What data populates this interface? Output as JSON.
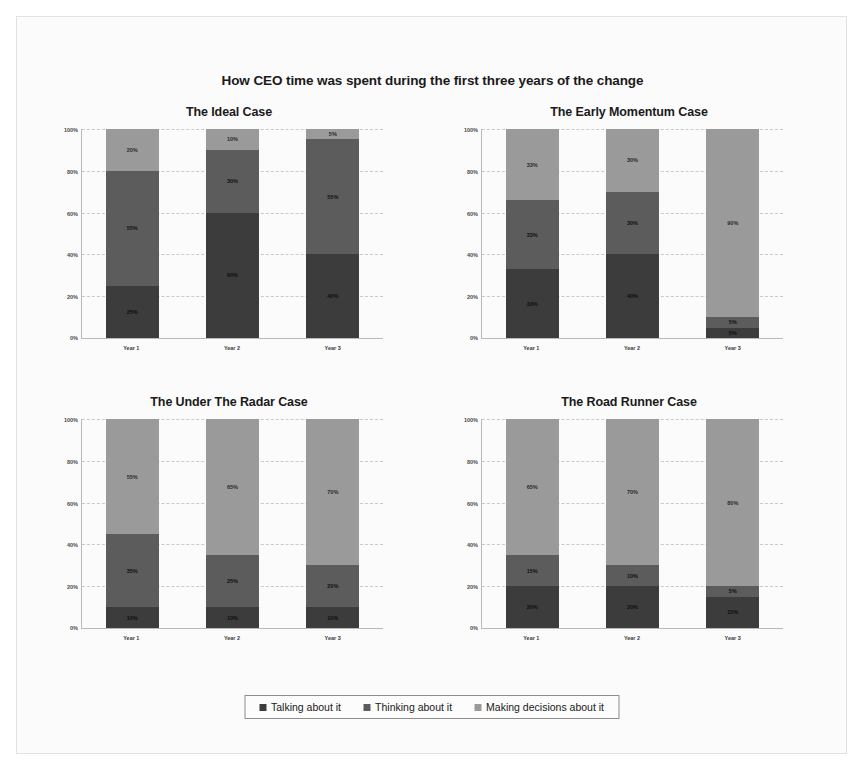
{
  "title": "How CEO time was spent during the first three years of the change",
  "legend": {
    "items": [
      {
        "label": "Talking about it",
        "color": "#3c3c3c"
      },
      {
        "label": "Thinking about it",
        "color": "#5c5c5c"
      },
      {
        "label": "Making decisions about it",
        "color": "#9a9a9a"
      }
    ]
  },
  "colors": {
    "talking": "#3c3c3c",
    "thinking": "#5c5c5c",
    "decisions": "#9a9a9a",
    "grid": "#c9c9c9",
    "axis": "#b9b9b9",
    "background": "#fbfbfb"
  },
  "yticks": [
    "100%",
    "80%",
    "60%",
    "40%",
    "20%",
    "0%"
  ],
  "chart_data": [
    {
      "type": "bar",
      "title": "The Ideal Case",
      "categories": [
        "Year 1",
        "Year 2",
        "Year 3"
      ],
      "xlabel": "",
      "ylabel": "",
      "ylim": [
        0,
        100
      ],
      "stacked": true,
      "grid": true,
      "legend_position": "bottom",
      "series": [
        {
          "name": "Talking about it",
          "values": [
            25,
            60,
            40
          ],
          "labels": [
            "25%",
            "60%",
            "40%"
          ]
        },
        {
          "name": "Thinking about it",
          "values": [
            55,
            30,
            55
          ],
          "labels": [
            "55%",
            "30%",
            "55%"
          ]
        },
        {
          "name": "Making decisions about it",
          "values": [
            20,
            10,
            5
          ],
          "labels": [
            "20%",
            "10%",
            "5%"
          ]
        }
      ]
    },
    {
      "type": "bar",
      "title": "The Early Momentum Case",
      "categories": [
        "Year 1",
        "Year 2",
        "Year 3"
      ],
      "xlabel": "",
      "ylabel": "",
      "ylim": [
        0,
        100
      ],
      "stacked": true,
      "grid": true,
      "legend_position": "bottom",
      "series": [
        {
          "name": "Talking about it",
          "values": [
            33,
            40,
            5
          ],
          "labels": [
            "33%",
            "40%",
            "5%"
          ]
        },
        {
          "name": "Thinking about it",
          "values": [
            33,
            30,
            5
          ],
          "labels": [
            "33%",
            "30%",
            "5%"
          ]
        },
        {
          "name": "Making decisions about it",
          "values": [
            34,
            30,
            90
          ],
          "labels": [
            "33%",
            "30%",
            "90%"
          ]
        }
      ]
    },
    {
      "type": "bar",
      "title": "The Under The Radar Case",
      "categories": [
        "Year 1",
        "Year 2",
        "Year 3"
      ],
      "xlabel": "",
      "ylabel": "",
      "ylim": [
        0,
        100
      ],
      "stacked": true,
      "grid": true,
      "legend_position": "bottom",
      "series": [
        {
          "name": "Talking about it",
          "values": [
            10,
            10,
            10
          ],
          "labels": [
            "10%",
            "10%",
            "10%"
          ]
        },
        {
          "name": "Thinking about it",
          "values": [
            35,
            25,
            20
          ],
          "labels": [
            "35%",
            "25%",
            "20%"
          ]
        },
        {
          "name": "Making decisions about it",
          "values": [
            55,
            65,
            70
          ],
          "labels": [
            "55%",
            "65%",
            "70%"
          ]
        }
      ]
    },
    {
      "type": "bar",
      "title": "The Road Runner Case",
      "categories": [
        "Year 1",
        "Year 2",
        "Year 3"
      ],
      "xlabel": "",
      "ylabel": "",
      "ylim": [
        0,
        100
      ],
      "stacked": true,
      "grid": true,
      "legend_position": "bottom",
      "series": [
        {
          "name": "Talking about it",
          "values": [
            20,
            20,
            15
          ],
          "labels": [
            "20%",
            "20%",
            "15%"
          ]
        },
        {
          "name": "Thinking about it",
          "values": [
            15,
            10,
            5
          ],
          "labels": [
            "15%",
            "10%",
            "5%"
          ]
        },
        {
          "name": "Making decisions about it",
          "values": [
            65,
            70,
            80
          ],
          "labels": [
            "65%",
            "70%",
            "80%"
          ]
        }
      ]
    }
  ]
}
